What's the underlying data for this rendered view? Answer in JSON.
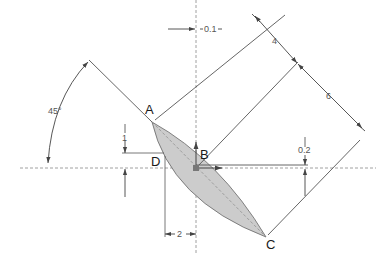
{
  "diagram": {
    "type": "engineering-drawing",
    "points": [
      {
        "id": "A",
        "label": "A"
      },
      {
        "id": "B",
        "label": "B"
      },
      {
        "id": "C",
        "label": "C"
      },
      {
        "id": "D",
        "label": "D"
      }
    ],
    "dimensions": {
      "angle": "45°",
      "offset_x_small": "0.1",
      "parallel_spacing_1": "4",
      "parallel_spacing_2": "6",
      "vertical_offset_left": "1",
      "vertical_offset_right": "0.2",
      "horizontal_offset": "2"
    },
    "colors": {
      "line": "#555555",
      "fill": "#cccccc",
      "centerline": "#888888",
      "text": "#1a1a1a"
    }
  }
}
